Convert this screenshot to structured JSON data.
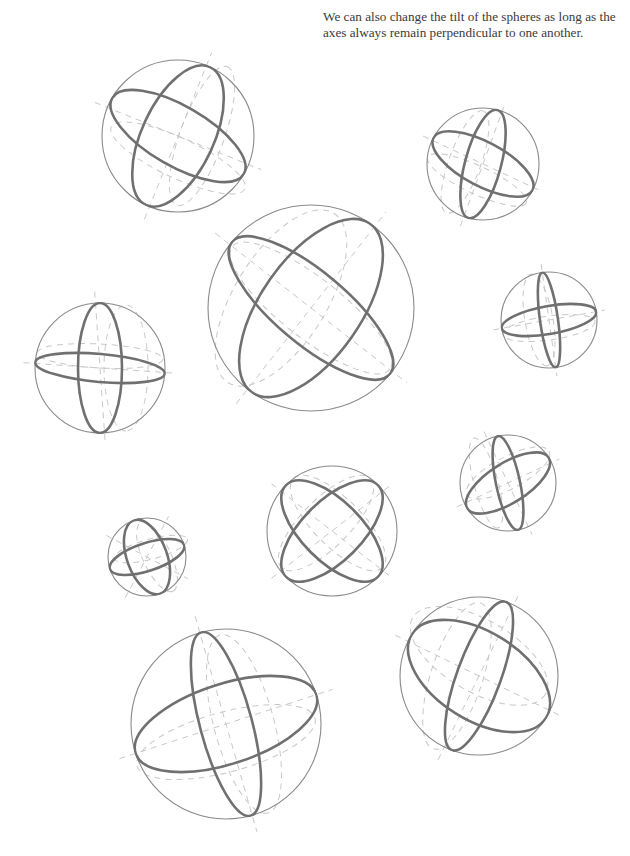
{
  "caption": {
    "text": "We can also change the tilt of the spheres as long as the axes always remain perpendicular to one another."
  },
  "colors": {
    "background": "#ffffff",
    "outline": "#8a8a8a",
    "great_circle": "#707070",
    "construction_dash": "#c8c8c8",
    "text": "#3a3a3a"
  },
  "spheres": [
    {
      "id": "sphere-1",
      "cx": 178,
      "cy": 136,
      "r": 76,
      "g1": {
        "rx": 76,
        "ry": 30,
        "rot": 30
      },
      "g2": {
        "rx": 76,
        "ry": 36,
        "rot": -65
      },
      "d1": {
        "rx": 76,
        "ry": 20,
        "rot": 25,
        "ox": 0,
        "oy": 22
      },
      "d2": {
        "rx": 76,
        "ry": 22,
        "rot": -70,
        "ox": 24,
        "oy": 0
      },
      "ax1": 22,
      "ax2": -68
    },
    {
      "id": "sphere-2",
      "cx": 483,
      "cy": 164,
      "r": 56,
      "g1": {
        "rx": 56,
        "ry": 22,
        "rot": 28
      },
      "g2": {
        "rx": 56,
        "ry": 18,
        "rot": -75
      },
      "d1": {
        "rx": 56,
        "ry": 14,
        "rot": 25,
        "ox": -6,
        "oy": 16
      },
      "d2": {
        "rx": 56,
        "ry": 16,
        "rot": -70,
        "ox": -18,
        "oy": -2
      },
      "ax1": 25,
      "ax2": -70
    },
    {
      "id": "sphere-3",
      "cx": 311,
      "cy": 308,
      "r": 103,
      "g1": {
        "rx": 103,
        "ry": 36,
        "rot": 40
      },
      "g2": {
        "rx": 103,
        "ry": 50,
        "rot": -55
      },
      "d1": {
        "rx": 103,
        "ry": 30,
        "rot": 38,
        "ox": 0,
        "oy": 0
      },
      "d2": {
        "rx": 103,
        "ry": 46,
        "rot": -58,
        "ox": -30,
        "oy": -10
      },
      "ax1": 38,
      "ax2": -52
    },
    {
      "id": "sphere-4",
      "cx": 549,
      "cy": 320,
      "r": 48,
      "g1": {
        "rx": 48,
        "ry": 14,
        "rot": -10
      },
      "g2": {
        "rx": 48,
        "ry": 9,
        "rot": 82
      },
      "d1": {
        "rx": 48,
        "ry": 12,
        "rot": -8,
        "ox": 0,
        "oy": 8
      },
      "d2": {
        "rx": 48,
        "ry": 14,
        "rot": 80,
        "ox": -10,
        "oy": 0
      },
      "ax1": -10,
      "ax2": 82
    },
    {
      "id": "sphere-5",
      "cx": 100,
      "cy": 368,
      "r": 65,
      "g1": {
        "rx": 65,
        "ry": 14,
        "rot": 5
      },
      "g2": {
        "rx": 65,
        "ry": 22,
        "rot": 90
      },
      "d1": {
        "rx": 65,
        "ry": 12,
        "rot": 3,
        "ox": 0,
        "oy": -12
      },
      "d2": {
        "rx": 65,
        "ry": 22,
        "rot": 90,
        "ox": 26,
        "oy": 0
      },
      "ax1": 4,
      "ax2": 86
    },
    {
      "id": "sphere-6",
      "cx": 508,
      "cy": 483,
      "r": 48,
      "g1": {
        "rx": 48,
        "ry": 20,
        "rot": -32
      },
      "g2": {
        "rx": 48,
        "ry": 12,
        "rot": 78
      },
      "d1": {
        "rx": 48,
        "ry": 16,
        "rot": -28,
        "ox": 0,
        "oy": -10
      },
      "d2": {
        "rx": 48,
        "ry": 12,
        "rot": 75,
        "ox": -22,
        "oy": 0
      },
      "ax1": -25,
      "ax2": 65
    },
    {
      "id": "sphere-7",
      "cx": 332,
      "cy": 531,
      "r": 65,
      "g1": {
        "rx": 65,
        "ry": 30,
        "rot": 45
      },
      "g2": {
        "rx": 65,
        "ry": 30,
        "rot": -45
      },
      "d1": {
        "rx": 65,
        "ry": 24,
        "rot": 45,
        "ox": 6,
        "oy": -8
      },
      "d2": {
        "rx": 65,
        "ry": 24,
        "rot": -45,
        "ox": -6,
        "oy": -8
      },
      "ax1": 38,
      "ax2": -38
    },
    {
      "id": "sphere-8",
      "cx": 147,
      "cy": 557,
      "r": 39,
      "g1": {
        "rx": 39,
        "ry": 14,
        "rot": -18
      },
      "g2": {
        "rx": 39,
        "ry": 20,
        "rot": 70
      },
      "d1": {
        "rx": 39,
        "ry": 10,
        "rot": -15,
        "ox": 4,
        "oy": -8
      },
      "d2": {
        "rx": 39,
        "ry": 14,
        "rot": 65,
        "ox": 10,
        "oy": 0
      },
      "ax1": 28,
      "ax2": -62
    },
    {
      "id": "sphere-9",
      "cx": 226,
      "cy": 724,
      "r": 95,
      "g1": {
        "rx": 95,
        "ry": 40,
        "rot": -18
      },
      "g2": {
        "rx": 95,
        "ry": 26,
        "rot": 75
      },
      "d1": {
        "rx": 95,
        "ry": 30,
        "rot": -15,
        "ox": 0,
        "oy": 18
      },
      "d2": {
        "rx": 95,
        "ry": 30,
        "rot": 75,
        "ox": 18,
        "oy": 0
      },
      "ax1": -18,
      "ax2": 74
    },
    {
      "id": "sphere-10",
      "cx": 479,
      "cy": 676,
      "r": 79,
      "g1": {
        "rx": 79,
        "ry": 44,
        "rot": 32
      },
      "g2": {
        "rx": 79,
        "ry": 22,
        "rot": -70
      },
      "d1": {
        "rx": 79,
        "ry": 36,
        "rot": 30,
        "ox": 0,
        "oy": -20
      },
      "d2": {
        "rx": 79,
        "ry": 26,
        "rot": -72,
        "ox": -22,
        "oy": 0
      },
      "ax1": 26,
      "ax2": -64
    }
  ]
}
